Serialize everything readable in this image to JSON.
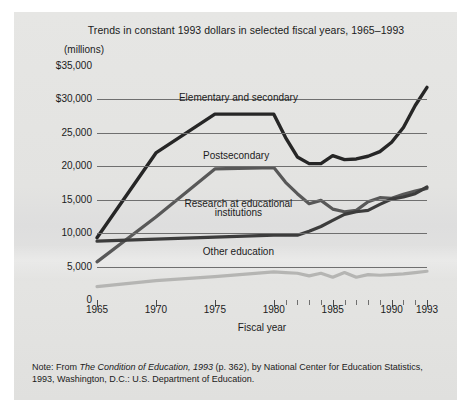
{
  "figure": {
    "title": "Trends in constant 1993 dollars in selected fiscal years, 1965–1993",
    "units_label": "(millions)",
    "xaxis_title": "Fiscal year",
    "note_prefix": "Note: From ",
    "note_italic": "The Condition of Education, 1993",
    "note_rest": " (p. 362), by National Center for Education Statistics, 1993, Washington, D.C.: U.S. Department of Education.",
    "panel_color": "#e3e3e1",
    "gridline_color": "#6f6f6f",
    "text_color": "#1b1b1b"
  },
  "chart_data": {
    "type": "line",
    "title": "Trends in constant 1993 dollars in selected fiscal years, 1965–1993",
    "xlabel": "Fiscal year",
    "ylabel": "(millions)",
    "xlim": [
      1965,
      1993
    ],
    "ylim": [
      0,
      35000
    ],
    "grid": true,
    "legend": "inline-annotations",
    "ytick_labels": [
      "$35,000",
      "$30,000",
      "25,000",
      "20,000",
      "15,000",
      "10,000",
      "5,000",
      "0"
    ],
    "ytick_values": [
      35000,
      30000,
      25000,
      20000,
      15000,
      10000,
      5000,
      0
    ],
    "xtick_labels": [
      "1965",
      "1970",
      "1975",
      "1980",
      "1985",
      "1990",
      "1993"
    ],
    "xtick_values": [
      1965,
      1970,
      1975,
      1980,
      1985,
      1990,
      1993
    ],
    "x": [
      1965,
      1970,
      1975,
      1980,
      1981,
      1982,
      1983,
      1984,
      1985,
      1986,
      1987,
      1988,
      1989,
      1990,
      1991,
      1992,
      1993
    ],
    "series": [
      {
        "name": "Elementary and secondary",
        "color": "#262626",
        "width": 3.4,
        "values": [
          9300,
          22000,
          27800,
          27800,
          24300,
          21400,
          20400,
          20400,
          21600,
          21000,
          21100,
          21500,
          22200,
          23600,
          25800,
          29100,
          31800
        ]
      },
      {
        "name": "Postsecondary",
        "color": "#585858",
        "width": 3.2,
        "values": [
          5700,
          12400,
          19600,
          19800,
          17600,
          15900,
          14400,
          14900,
          13600,
          13200,
          13400,
          14700,
          15300,
          15200,
          15800,
          16300,
          16700
        ]
      },
      {
        "name": "Research at educational institutions",
        "color": "#3c3c3c",
        "width": 3.2,
        "values": [
          8800,
          9100,
          9400,
          9700,
          9700,
          9700,
          10300,
          11000,
          11900,
          12800,
          13200,
          13400,
          14300,
          15100,
          15400,
          15900,
          16900
        ]
      },
      {
        "name": "Other education",
        "color": "#b5b5b3",
        "width": 3.2,
        "values": [
          2000,
          2900,
          3500,
          4200,
          4100,
          4000,
          3600,
          4000,
          3400,
          4100,
          3400,
          3800,
          3700,
          3800,
          3900,
          4100,
          4300
        ]
      }
    ],
    "annotations": [
      {
        "text": "Elementary and secondary",
        "x": 1977.0,
        "y": 30200
      },
      {
        "text": "Postsecondary",
        "x": 1976.8,
        "y": 21600
      },
      {
        "text": "Research at educational",
        "x": 1977.0,
        "y": 14400
      },
      {
        "text": "institutions",
        "x": 1977.0,
        "y": 13000
      },
      {
        "text": "Other education",
        "x": 1977.0,
        "y": 7200
      }
    ]
  }
}
